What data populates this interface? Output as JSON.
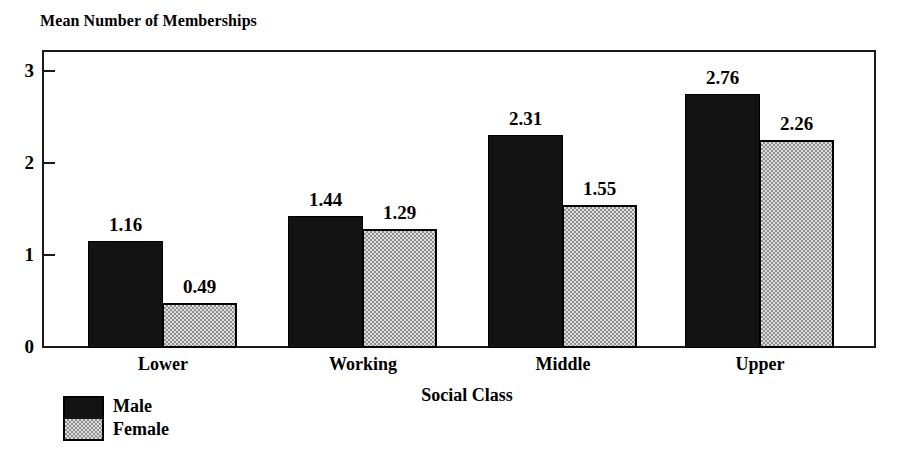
{
  "chart_data": {
    "type": "bar",
    "title": "",
    "ylabel": "Mean Number of Memberships",
    "xlabel": "Social Class",
    "categories": [
      "Lower",
      "Working",
      "Middle",
      "Upper"
    ],
    "series": [
      {
        "name": "Male",
        "values": [
          1.16,
          1.44,
          2.31,
          2.76
        ],
        "color": "#131313",
        "pattern": "solid"
      },
      {
        "name": "Female",
        "values": [
          0.49,
          1.29,
          1.55,
          2.26
        ],
        "color": "#b9b9b9",
        "pattern": "checkered"
      }
    ],
    "value_labels": [
      [
        "1.16",
        "0.49"
      ],
      [
        "1.44",
        "1.29"
      ],
      [
        "2.31",
        "1.55"
      ],
      [
        "2.76",
        "2.26"
      ]
    ],
    "ylim": [
      0,
      3.24
    ],
    "yticks": [
      0,
      1,
      2,
      3
    ],
    "ytick_labels": [
      "0",
      "1",
      "2",
      "3"
    ],
    "grid": false,
    "legend_position": "bottom-left",
    "frame": "box"
  },
  "legend": {
    "entries": [
      {
        "label": "Male"
      },
      {
        "label": "Female"
      }
    ]
  }
}
